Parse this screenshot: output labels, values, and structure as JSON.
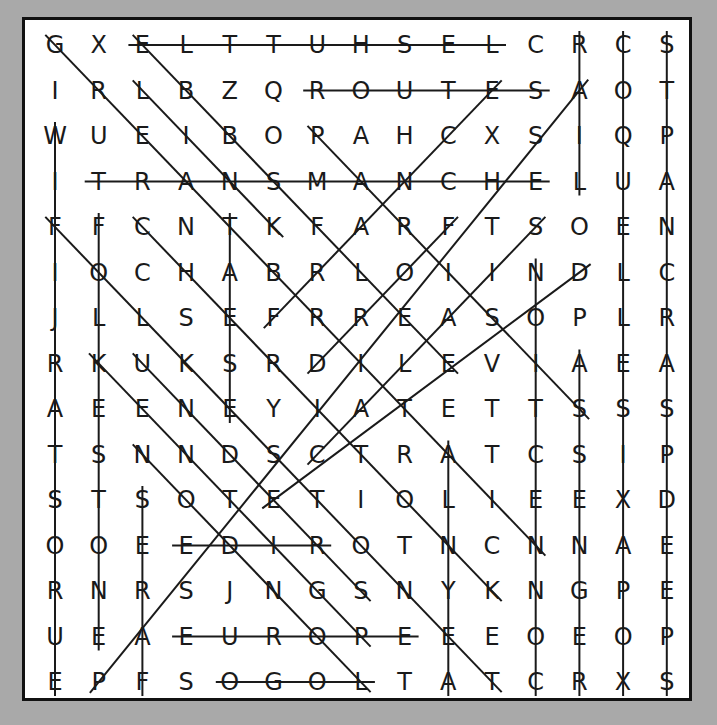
{
  "puzzle": {
    "grid": [
      "GXELTTUHSELCRCS",
      "IRLBZQROUTESAOT",
      "WUEIBOPAHCXSIQP",
      "ITRANSMANCHELUA",
      "FFCNTKFARFTSOEN",
      "IOCHABRLOIINDLC",
      "JLLSEFRREASOPLR",
      "RKUKSRDILEVIAEA",
      "AEENEYIATETTSSS",
      "TSNNDSCTRATCSIP",
      "STSOTETIOLIEEXD",
      "OOEEDIROTNCNNAE",
      "RNRSJNGSNYKNGPE",
      "UEAEUROPEEEOEOP",
      "EPFSOGOLTATCRXS"
    ],
    "found_lines": [
      {
        "r1": 0,
        "c1": 2,
        "r2": 0,
        "c2": 10
      },
      {
        "r1": 1,
        "c1": 6,
        "r2": 1,
        "c2": 11
      },
      {
        "r1": 3,
        "c1": 1,
        "r2": 3,
        "c2": 11
      },
      {
        "r1": 11,
        "c1": 3,
        "r2": 11,
        "c2": 6
      },
      {
        "r1": 13,
        "c1": 3,
        "r2": 13,
        "c2": 8
      },
      {
        "r1": 14,
        "c1": 4,
        "r2": 14,
        "c2": 7
      },
      {
        "r1": 0,
        "c1": 12,
        "r2": 3,
        "c2": 12
      },
      {
        "r1": 0,
        "c1": 13,
        "r2": 14,
        "c2": 13
      },
      {
        "r1": 0,
        "c1": 14,
        "r2": 14,
        "c2": 14
      },
      {
        "r1": 2,
        "c1": 0,
        "r2": 14,
        "c2": 0
      },
      {
        "r1": 4,
        "c1": 1,
        "r2": 13,
        "c2": 1
      },
      {
        "r1": 10,
        "c1": 2,
        "r2": 14,
        "c2": 2
      },
      {
        "r1": 4,
        "c1": 4,
        "r2": 8,
        "c2": 4
      },
      {
        "r1": 5,
        "c1": 11,
        "r2": 14,
        "c2": 11
      },
      {
        "r1": 7,
        "c1": 12,
        "r2": 14,
        "c2": 12
      },
      {
        "r1": 9,
        "c1": 9,
        "r2": 14,
        "c2": 9
      },
      {
        "r1": 0,
        "c1": 0,
        "r2": 11,
        "c2": 11
      },
      {
        "r1": 0,
        "c1": 2,
        "r2": 7,
        "c2": 9
      },
      {
        "r1": 1,
        "c1": 2,
        "r2": 4,
        "c2": 5
      },
      {
        "r1": 2,
        "c1": 6,
        "r2": 8,
        "c2": 12
      },
      {
        "r1": 4,
        "c1": 0,
        "r2": 14,
        "c2": 10
      },
      {
        "r1": 4,
        "c1": 2,
        "r2": 12,
        "c2": 10
      },
      {
        "r1": 7,
        "c1": 1,
        "r2": 13,
        "c2": 7
      },
      {
        "r1": 7,
        "c1": 2,
        "r2": 12,
        "c2": 7
      },
      {
        "r1": 9,
        "c1": 2,
        "r2": 14,
        "c2": 7
      },
      {
        "r1": 14,
        "c1": 1,
        "r2": 1,
        "c2": 12
      },
      {
        "r1": 6,
        "c1": 5,
        "r2": 1,
        "c2": 10
      },
      {
        "r1": 7,
        "c1": 6,
        "r2": 4,
        "c2": 9
      },
      {
        "r1": 9,
        "c1": 6,
        "r2": 4,
        "c2": 11
      },
      {
        "r1": 10,
        "c1": 5,
        "r2": 5,
        "c2": 12
      }
    ]
  }
}
